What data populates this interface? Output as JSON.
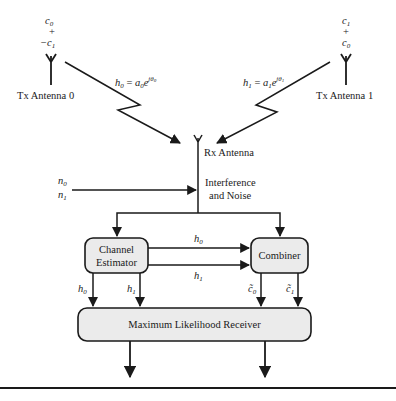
{
  "diagram": {
    "tx_antenna_0": {
      "label": "Tx Antenna 0",
      "symbols": [
        "c0",
        "+",
        "−c1"
      ],
      "symbols_display": {
        "top": "c",
        "top_sub": "0",
        "mid": "+",
        "bottom": "−c",
        "bottom_sub": "1"
      }
    },
    "tx_antenna_1": {
      "label": "Tx Antenna 1",
      "symbols": [
        "c1",
        "+",
        "c0"
      ],
      "symbols_display": {
        "top": "c",
        "top_sub": "1",
        "mid": "+",
        "bottom": "c",
        "bottom_sub": "0"
      }
    },
    "channel_0": {
      "label": "h0 = a0e^{jθ0}",
      "h": "h",
      "h_sub": "0",
      "eq": " = ",
      "a": "a",
      "a_sub": "0",
      "e": "e",
      "exp": "jθ",
      "exp_sub": "0"
    },
    "channel_1": {
      "label": "h1 = a1e^{jθ1}",
      "h": "h",
      "h_sub": "1",
      "eq": " = ",
      "a": "a",
      "a_sub": "1",
      "e": "e",
      "exp": "jθ",
      "exp_sub": "1"
    },
    "rx_antenna": {
      "label": "Rx Antenna"
    },
    "noise": {
      "inputs": [
        "n0",
        "n1"
      ],
      "n0": "n",
      "n0_sub": "0",
      "n1": "n",
      "n1_sub": "1",
      "label_line1": "Interference",
      "label_line2": "and Noise"
    },
    "channel_estimator": {
      "line1": "Channel",
      "line2": "Estimator"
    },
    "combiner": {
      "label": "Combiner"
    },
    "est_to_combiner": [
      {
        "label": "h0",
        "base": "h",
        "sub": "0"
      },
      {
        "label": "h1",
        "base": "h",
        "sub": "1"
      }
    ],
    "est_to_ml": [
      {
        "label": "h0",
        "base": "h",
        "sub": "0"
      },
      {
        "label": "h1",
        "base": "h",
        "sub": "1"
      }
    ],
    "combiner_to_ml": [
      {
        "label": "c̃0",
        "base": "c̃",
        "sub": "0"
      },
      {
        "label": "c̃1",
        "base": "c̃",
        "sub": "1"
      }
    ],
    "ml_receiver": {
      "label": "Maximum Likelihood Receiver"
    },
    "colors": {
      "stroke": "#1a1a1a",
      "box_fill": "#ebebeb",
      "background": "#ffffff"
    }
  },
  "caption": {
    "text": ""
  }
}
